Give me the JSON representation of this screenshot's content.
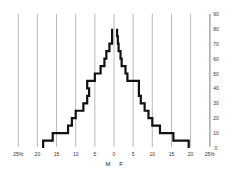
{
  "chart_data": {
    "type": "bar",
    "subtype": "population-pyramid",
    "title": "",
    "xlabel": "",
    "ylabel": "",
    "x_unit": "%",
    "sex_labels": {
      "left": "M",
      "right": "F"
    },
    "x_tick_labels": [
      "25%",
      "20",
      "15",
      "10",
      "5",
      "0",
      "5",
      "10",
      "15",
      "20",
      "25%"
    ],
    "x_ticks": [
      -25,
      -20,
      -15,
      -10,
      -5,
      0,
      5,
      10,
      15,
      20,
      25
    ],
    "y_tick_labels": [
      "0",
      "10",
      "20",
      "30",
      "40",
      "50",
      "60",
      "70",
      "80",
      "90"
    ],
    "y_ticks": [
      0,
      10,
      20,
      30,
      40,
      50,
      60,
      70,
      80,
      90
    ],
    "xlim": [
      -25,
      25
    ],
    "ylim": [
      0,
      90
    ],
    "grid": "vertical",
    "categories": [
      "0-5",
      "5-10",
      "10-15",
      "15-20",
      "20-25",
      "25-30",
      "30-35",
      "35-40",
      "40-45",
      "45-50",
      "50-55",
      "55-60",
      "60-65",
      "65-70",
      "70-75",
      "75-80"
    ],
    "series": [
      {
        "name": "M",
        "side": "left",
        "values": [
          18.5,
          16,
          12,
          11,
          10,
          8,
          7,
          6.5,
          7,
          5,
          3.5,
          2.5,
          2,
          1.2,
          0.5,
          0.5
        ]
      },
      {
        "name": "F",
        "side": "right",
        "values": [
          19.5,
          15.5,
          12,
          10,
          9,
          8,
          7,
          6.5,
          6.5,
          3.5,
          3,
          2,
          1.7,
          1.2,
          1,
          0.8
        ]
      }
    ]
  }
}
